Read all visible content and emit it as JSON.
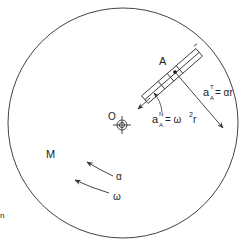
{
  "diagram": {
    "type": "rotating-disk-kinematics",
    "disk": {
      "label": "M",
      "cx": 123,
      "cy": 123,
      "r": 115
    },
    "center": {
      "label": "O"
    },
    "point": {
      "label": "A"
    },
    "labels": {
      "tangential": {
        "base": "a",
        "sup": "T",
        "sub": "A",
        "rhs": "= αr"
      },
      "normal": {
        "base": "a",
        "sup": "N",
        "sub": "A",
        "rhs": "= ω",
        "rhs_sup": "2",
        "rhs_tail": " r"
      },
      "alpha": "α",
      "omega": "ω",
      "edge_fragment": "n"
    },
    "colors": {
      "stroke": "#333333",
      "text": "#222222",
      "background": "#ffffff"
    }
  }
}
